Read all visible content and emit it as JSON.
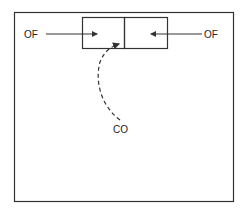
{
  "diagram": {
    "labels": {
      "left": "OF",
      "right": "OF",
      "bottom": "CO"
    },
    "colors": {
      "stroke": "#333333",
      "background": "#ffffff"
    }
  }
}
